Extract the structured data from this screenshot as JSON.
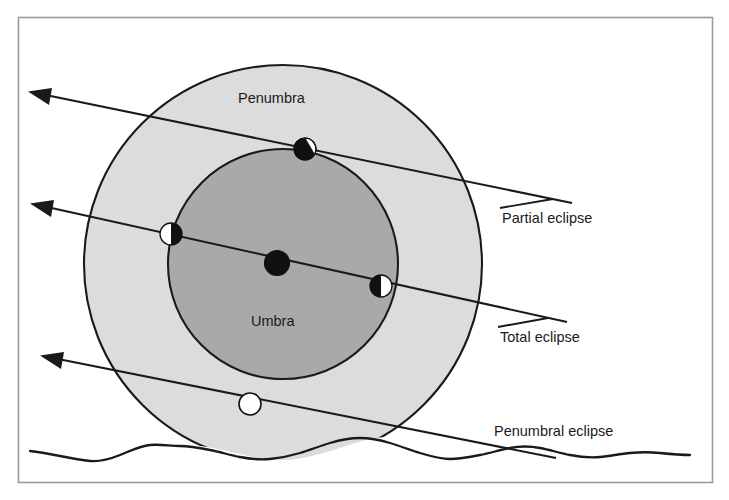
{
  "figure": {
    "type": "diagram",
    "frame": {
      "border_color": "#9a9a9a",
      "background_color": "#ffffff",
      "x": 18,
      "y": 17,
      "width": 695,
      "height": 466
    }
  },
  "colors": {
    "penumbra_fill": "#dcdcdc",
    "umbra_fill": "#a9a9a9",
    "outline": "#1a1a1a",
    "moon_light": "#ffffff",
    "moon_dark": "#111111",
    "label_text": "#1a1a1a",
    "terrain_line": "#1a1a1a"
  },
  "shadow_regions": [
    {
      "name": "penumbra",
      "label": "Penumbra",
      "label_x": 238,
      "label_y": 103,
      "center_x": 283,
      "center_y": 264,
      "radius": 199,
      "fill": "#dcdcdc"
    },
    {
      "name": "umbra",
      "label": "Umbra",
      "label_x": 251,
      "label_y": 326,
      "center_x": 283,
      "center_y": 264,
      "radius": 115,
      "fill": "#a9a9a9"
    }
  ],
  "eclipse_paths": [
    {
      "name": "partial-eclipse-path",
      "label": "Partial eclipse",
      "label_x": 502,
      "label_y": 223,
      "arrow_tip_x": 29,
      "arrow_tip_y": 93,
      "start_x": 572,
      "start_y": 203,
      "moon_positions": [
        {
          "name": "moon-partially-eclipsed",
          "x": 305,
          "y": 149,
          "radius": 11,
          "phase": "partial",
          "lit_fraction": 0.25
        }
      ]
    },
    {
      "name": "total-eclipse-path",
      "label": "Total eclipse",
      "label_x": 500,
      "label_y": 342,
      "arrow_tip_x": 31,
      "arrow_tip_y": 205,
      "start_x": 567,
      "start_y": 322,
      "moon_positions": [
        {
          "name": "moon-entering-umbra",
          "x": 171,
          "y": 234,
          "radius": 11,
          "phase": "half-left-lit",
          "lit_fraction": 0.5
        },
        {
          "name": "moon-fully-eclipsed",
          "x": 277,
          "y": 263,
          "radius": 12,
          "phase": "total",
          "lit_fraction": 0
        },
        {
          "name": "moon-exiting-umbra",
          "x": 381,
          "y": 286,
          "radius": 11,
          "phase": "half-right-lit",
          "lit_fraction": 0.5
        }
      ]
    },
    {
      "name": "penumbral-eclipse-path",
      "label": "Penumbral eclipse",
      "label_x": 494,
      "label_y": 436,
      "arrow_tip_x": 41,
      "arrow_tip_y": 357,
      "start_x": 556,
      "start_y": 458,
      "moon_positions": [
        {
          "name": "moon-in-penumbra",
          "x": 250,
          "y": 404,
          "radius": 11,
          "phase": "uneclipsed",
          "lit_fraction": 1
        }
      ]
    }
  ],
  "terrain": {
    "name": "horizon-terrain",
    "label": "",
    "stroke": "#1a1a1a",
    "stroke_width": 2.2
  },
  "labels": {
    "penumbra": "Penumbra",
    "umbra": "Umbra",
    "partial_eclipse": "Partial eclipse",
    "total_eclipse": "Total eclipse",
    "penumbral_eclipse": "Penumbral eclipse"
  }
}
